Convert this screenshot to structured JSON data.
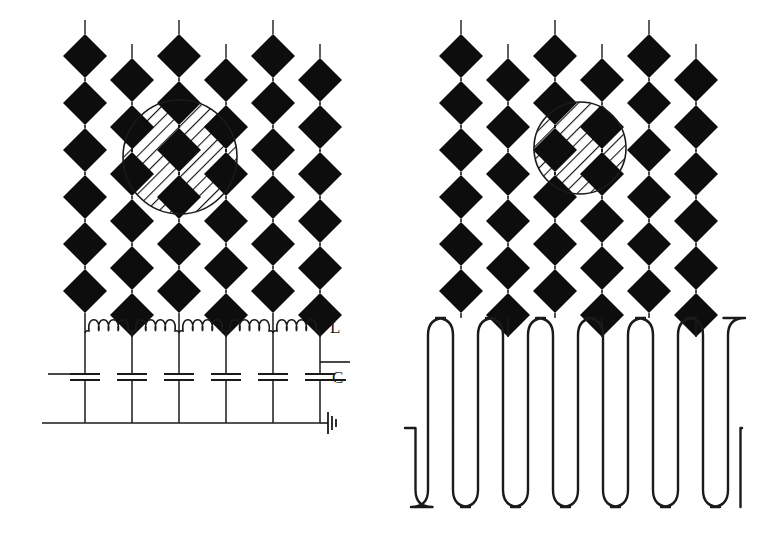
{
  "figure": {
    "width": 775,
    "height": 554,
    "background": "#ffffff",
    "ink_color": "#111111",
    "diamond_fill": "#0d0d0d",
    "line_color": "#1a1a1a"
  },
  "panels": [
    {
      "id": "left",
      "name": "lumped-element-circuit-panel",
      "origin_x": 0,
      "bottom_section": "lc-ladder-network",
      "labels": [
        {
          "name": "inductor-label",
          "text": "L",
          "x": 330,
          "y": 333
        },
        {
          "name": "capacitor-label",
          "text": "C",
          "x": 332,
          "y": 383
        }
      ],
      "columns": [
        {
          "index": 0,
          "x": 85,
          "top_y": 34,
          "diamonds": 6,
          "stem_up": true
        },
        {
          "index": 1,
          "x": 132,
          "top_y": 58,
          "diamonds": 6,
          "stem_up": true
        },
        {
          "index": 2,
          "x": 179,
          "top_y": 34,
          "diamonds": 6,
          "stem_up": true
        },
        {
          "index": 3,
          "x": 226,
          "top_y": 58,
          "diamonds": 6,
          "stem_up": true
        },
        {
          "index": 4,
          "x": 273,
          "top_y": 34,
          "diamonds": 6,
          "stem_up": true
        },
        {
          "index": 5,
          "x": 320,
          "top_y": 58,
          "diamonds": 6,
          "stem_up": true
        }
      ],
      "hatched_circle": {
        "name": "coupling-region-circle",
        "cx": 180,
        "cy": 157,
        "r": 57,
        "hatch_angle_deg": 45
      },
      "circuit": {
        "inductor_count": 5,
        "inductor_loops": 4,
        "inductor_y": 333,
        "capacitor_count": 6,
        "capacitor_y": 377,
        "ground_rail_y": 423,
        "ground_symbol": {
          "name": "ground-symbol",
          "x": 320,
          "y": 423
        }
      }
    },
    {
      "id": "right",
      "name": "meander-line-realization-panel",
      "origin_x": 388,
      "bottom_section": "meander-line",
      "labels": [],
      "columns": [
        {
          "index": 0,
          "x": 73,
          "top_y": 34,
          "diamonds": 6,
          "stem_up": true
        },
        {
          "index": 1,
          "x": 120,
          "top_y": 58,
          "diamonds": 6,
          "stem_up": true
        },
        {
          "index": 2,
          "x": 167,
          "top_y": 34,
          "diamonds": 6,
          "stem_up": true
        },
        {
          "index": 3,
          "x": 214,
          "top_y": 58,
          "diamonds": 6,
          "stem_up": true
        },
        {
          "index": 4,
          "x": 261,
          "top_y": 34,
          "diamonds": 6,
          "stem_up": true
        },
        {
          "index": 5,
          "x": 308,
          "top_y": 58,
          "diamonds": 6,
          "stem_up": true
        }
      ],
      "hatched_circle": {
        "name": "coupling-region-circle",
        "cx": 192,
        "cy": 148,
        "r": 46,
        "hatch_angle_deg": 45
      },
      "meander": {
        "top_y": 318,
        "bottom_y": 507,
        "lead_y": 428,
        "left_lead_x": 405,
        "right_lead_x": 742,
        "finger_count": 13,
        "corner_radius": 17
      }
    }
  ],
  "geometry": {
    "diamond_half_width": 22,
    "diamond_half_height": 22,
    "vertical_period": 47,
    "stem_length": 14,
    "column_pitch": 47,
    "chain_link_length": 3
  },
  "legend": {
    "inductor_symbol": "coil",
    "capacitor_symbol": "parallel-plates",
    "ground_symbol": "earth-bars"
  }
}
